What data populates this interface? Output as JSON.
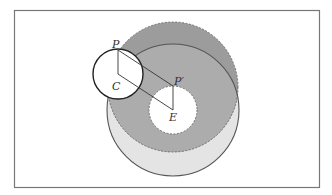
{
  "diagram": {
    "frame": {
      "x": 14,
      "y": 10,
      "width": 305,
      "height": 177,
      "stroke": "#777777"
    },
    "colors": {
      "dashed_annulus": "#9c9c9c",
      "overlap": "#acacac",
      "solid_only": "#e4e4e4",
      "hole": "#ffffff",
      "line": "#333333"
    },
    "circles": {
      "solid_large": {
        "cx": 173,
        "cy": 110,
        "r": 66,
        "style": "solid"
      },
      "dashed_large": {
        "cx": 173,
        "cy": 87,
        "r": 65,
        "style": "dashed"
      },
      "dashed_hole": {
        "cx": 173,
        "cy": 110,
        "r": 24,
        "style": "dashed"
      },
      "small_C": {
        "cx": 118,
        "cy": 74,
        "r": 25,
        "style": "solid"
      }
    },
    "points": {
      "P": {
        "x": 118,
        "y": 50
      },
      "C": {
        "x": 118,
        "y": 74
      },
      "P_prime": {
        "x": 173,
        "y": 86
      },
      "E": {
        "x": 173,
        "y": 110
      }
    },
    "labels": {
      "P": "P",
      "C": "C",
      "P_prime": "P′",
      "E": "E"
    }
  }
}
